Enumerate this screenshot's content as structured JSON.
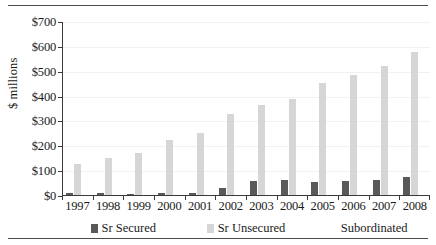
{
  "chart_data": {
    "type": "bar",
    "title": "",
    "subtitle": "",
    "xlabel": "",
    "ylabel": "$ millions",
    "ylim": [
      0,
      700
    ],
    "ytick_labels": [
      "$0",
      "$100",
      "$200",
      "$300",
      "$400",
      "$500",
      "$600",
      "$700"
    ],
    "ytick_values": [
      0,
      100,
      200,
      300,
      400,
      500,
      600,
      700
    ],
    "grid": true,
    "legend_position": "bottom",
    "categories": [
      "1997",
      "1998",
      "1999",
      "2000",
      "2001",
      "2002",
      "2003",
      "2004",
      "2005",
      "2006",
      "2007",
      "2008"
    ],
    "series": [
      {
        "name": "Sr Secured",
        "color": "#595959",
        "values": [
          12,
          11,
          8,
          11,
          13,
          34,
          59,
          64,
          55,
          59,
          64,
          78
        ]
      },
      {
        "name": "Sr Unsecured",
        "color": "#d6d6d6",
        "values": [
          128,
          153,
          174,
          226,
          253,
          328,
          367,
          390,
          453,
          486,
          523,
          578
        ]
      },
      {
        "name": "Subordinated",
        "color": "#ffffff",
        "values": [
          0,
          0,
          0,
          0,
          0,
          0,
          0,
          0,
          0,
          0,
          0,
          0
        ]
      }
    ]
  },
  "legend": {
    "items": [
      {
        "label": "Sr Secured"
      },
      {
        "label": "Sr Unsecured"
      },
      {
        "label": "Subordinated"
      }
    ]
  }
}
